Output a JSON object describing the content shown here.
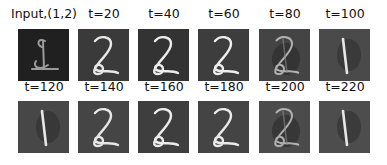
{
  "figure": {
    "rows": [
      {
        "cells": [
          {
            "label": "Input,(1,2)",
            "digit": "2-overlay",
            "bg": "#202020",
            "stroke": "#9a9a9a"
          },
          {
            "label": "t=20",
            "digit": "2",
            "bg": "#3a3a3a",
            "stroke": "#e8e8e8"
          },
          {
            "label": "t=40",
            "digit": "2",
            "bg": "#333333",
            "stroke": "#ececec"
          },
          {
            "label": "t=60",
            "digit": "2",
            "bg": "#3d3d3d",
            "stroke": "#eeeeee"
          },
          {
            "label": "t=80",
            "digit": "2-blend",
            "bg": "#444444",
            "stroke": "#cfcfcf"
          },
          {
            "label": "t=100",
            "digit": "1",
            "bg": "#4a4a4a",
            "stroke": "#e6e6e6"
          }
        ]
      },
      {
        "cells": [
          {
            "label": "t=120",
            "digit": "1",
            "bg": "#474747",
            "stroke": "#e6e6e6"
          },
          {
            "label": "t=140",
            "digit": "2",
            "bg": "#454545",
            "stroke": "#e6e6e6"
          },
          {
            "label": "t=160",
            "digit": "2",
            "bg": "#3e3e3e",
            "stroke": "#ececec"
          },
          {
            "label": "t=180",
            "digit": "2",
            "bg": "#444444",
            "stroke": "#eaeaea"
          },
          {
            "label": "t=200",
            "digit": "2-blend",
            "bg": "#4b4b4b",
            "stroke": "#cccccc"
          },
          {
            "label": "t=220",
            "digit": "1",
            "bg": "#4d4d4d",
            "stroke": "#e6e6e6"
          }
        ]
      }
    ]
  }
}
